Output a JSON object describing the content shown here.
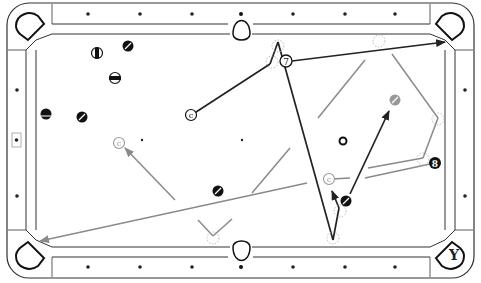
{
  "diagram": {
    "type": "pool-table-shot-diagram",
    "colors": {
      "rail_line": "#333333",
      "primary_path": "#222222",
      "secondary_path": "#8a8a8a",
      "ghost_ball": "#9a9a9a",
      "ball_dark": "#1a1a1a"
    },
    "labels": {
      "object_ball_7": "7",
      "object_ball_8": "8",
      "cue_ball_main": "c",
      "cue_ball_ghost_left": "c",
      "cue_ball_ghost_right": "c",
      "pocket_target": "Y"
    },
    "balls": [
      {
        "id": "stripe-1",
        "x": 97,
        "y": 53,
        "style": "stripe-vertical"
      },
      {
        "id": "solid-1",
        "x": 128,
        "y": 46,
        "style": "solid-diag"
      },
      {
        "id": "stripe-2",
        "x": 115,
        "y": 78,
        "style": "stripe-horizontal"
      },
      {
        "id": "stripe-3",
        "x": 46,
        "y": 114,
        "style": "stripe-horizontal"
      },
      {
        "id": "solid-2",
        "x": 82,
        "y": 117,
        "style": "solid-diag"
      },
      {
        "id": "solid-3",
        "x": 218,
        "y": 191,
        "style": "solid-diag"
      },
      {
        "id": "solid-4",
        "x": 346,
        "y": 201,
        "style": "solid-diag"
      },
      {
        "id": "gray-ball",
        "x": 395,
        "y": 100,
        "style": "gray-stripe"
      },
      {
        "id": "ring-ball",
        "x": 343,
        "y": 141,
        "style": "ring"
      }
    ]
  }
}
